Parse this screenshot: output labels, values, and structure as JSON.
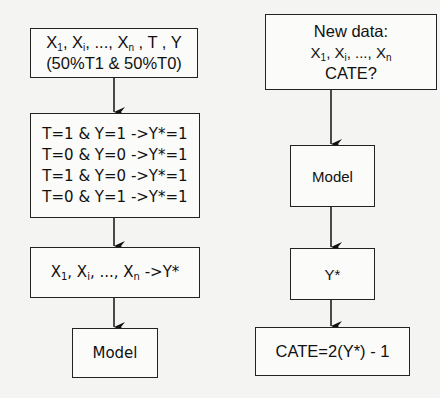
{
  "left_flow": {
    "input_box": {
      "line1": {
        "vars": [
          "X",
          "1",
          ", X",
          "i",
          ", ..., X",
          "n",
          " , T , Y"
        ]
      },
      "line2": "(50%T1 & 50%T0)"
    },
    "transform_box": {
      "rules": [
        "T=1 & Y=1 ->Y*=1",
        "T=0 & Y=0 ->Y*=1",
        "T=1 & Y=0 ->Y*=1",
        "T=0 & Y=1 ->Y*=1"
      ]
    },
    "mapping_box": {
      "vars": [
        "X",
        "1",
        ", X",
        "i",
        ", ..., X",
        "n",
        " ->Y*"
      ]
    },
    "model_box": {
      "label": "Model"
    }
  },
  "right_flow": {
    "new_data_box": {
      "title": "New data:",
      "vars": [
        "X",
        "1",
        ", X",
        "i",
        ", ..., X",
        "n"
      ],
      "question": "CATE?"
    },
    "model_box": {
      "label": "Model"
    },
    "output_box": {
      "label": "Y*"
    },
    "cate_box": {
      "label": "CATE=2(Y*) - 1"
    }
  },
  "style": {
    "line_color": "#111111",
    "box_fill": "#fbfbfa",
    "page_bg": "#f4f4f2"
  }
}
